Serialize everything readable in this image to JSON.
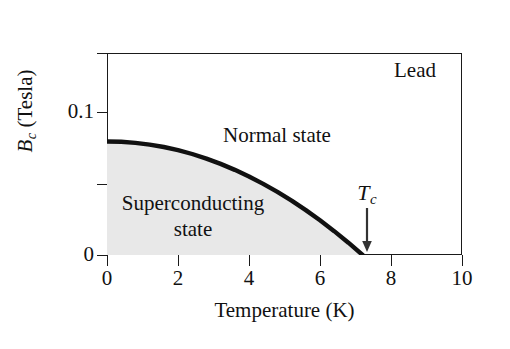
{
  "chart_data": {
    "type": "line",
    "title": "",
    "annotation_material": "Lead",
    "xlabel": "Temperature (K)",
    "ylabel_main": "B",
    "ylabel_sub": "c",
    "ylabel_units": "(Tesla)",
    "ylabel_full": "B_c (Tesla)",
    "xlim": [
      0,
      10
    ],
    "ylim": [
      0,
      0.1414
    ],
    "xticks": [
      0,
      2,
      4,
      6,
      8,
      10
    ],
    "xtick_labels": [
      "0",
      "2",
      "4",
      "6",
      "8",
      "10"
    ],
    "yticks": [
      0,
      0.05,
      0.1,
      0.1414
    ],
    "ytick_labels": [
      "0",
      "",
      "0.1",
      ""
    ],
    "grid": false,
    "legend": null,
    "curve_label": "critical field Bc(T)",
    "curve_color": "#111111",
    "fill_color": "#e8e8e8",
    "fill_label": "Superconducting state region",
    "critical_temperature": 7.2,
    "critical_field_at_zero": 0.0795,
    "region_labels": [
      {
        "name": "normal",
        "text": "Normal state"
      },
      {
        "name": "superconducting",
        "line1": "Superconducting",
        "line2": "state"
      }
    ],
    "tc_marker": {
      "label_main": "T",
      "label_sub": "c",
      "value": 7.2,
      "arrow": "down-arrow"
    },
    "x": [
      0.0,
      0.4,
      0.8,
      1.2,
      1.6,
      2.0,
      2.4,
      2.8,
      3.2,
      3.6,
      4.0,
      4.4,
      4.8,
      5.2,
      5.6,
      6.0,
      6.4,
      6.8,
      7.2
    ],
    "y": [
      0.0795,
      0.0793,
      0.0785,
      0.0773,
      0.0756,
      0.0734,
      0.0707,
      0.0675,
      0.0638,
      0.0596,
      0.055,
      0.0498,
      0.0442,
      0.0381,
      0.0314,
      0.0243,
      0.0167,
      0.0086,
      0.0
    ]
  },
  "axis": {
    "x_title": "Temperature (K)",
    "y_title_main": "B",
    "y_title_sub": "c",
    "y_title_units": " (Tesla)"
  },
  "ticks": {
    "x": [
      {
        "value": 0,
        "label": "0"
      },
      {
        "value": 2,
        "label": "2"
      },
      {
        "value": 4,
        "label": "4"
      },
      {
        "value": 6,
        "label": "6"
      },
      {
        "value": 8,
        "label": "8"
      },
      {
        "value": 10,
        "label": "10"
      }
    ],
    "y": [
      {
        "value": 0,
        "label": "0"
      },
      {
        "value": 0.05,
        "label": ""
      },
      {
        "value": 0.1,
        "label": "0.1"
      },
      {
        "value": 0.1414,
        "label": ""
      }
    ]
  },
  "annotations": {
    "material": "Lead",
    "normal_state": "Normal state",
    "superconducting_line1": "Superconducting",
    "superconducting_line2": "state",
    "tc_main": "T",
    "tc_sub": "c"
  }
}
